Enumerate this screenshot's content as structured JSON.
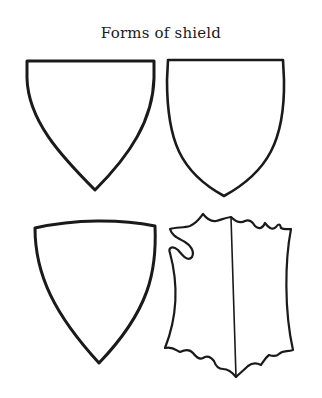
{
  "title": "Forms of shield",
  "shields": [
    {
      "name": "shield-pointed"
    },
    {
      "name": "shield-rounded-point"
    },
    {
      "name": "shield-arched-top"
    },
    {
      "name": "shield-tournament-notched"
    }
  ],
  "colors": {
    "stroke": "#1a1a1a",
    "background": "#ffffff"
  }
}
